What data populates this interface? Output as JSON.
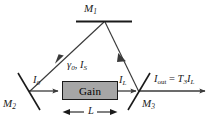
{
  "figure": {
    "type": "ring-laser-cavity-diagram",
    "background_color": "#ffffff",
    "line_color": "#3a3a3a",
    "mirror_color": "#1a1a1a",
    "gain_fill_color": "#a6a6a6",
    "gain_border_color": "#1a1a1a"
  },
  "mirrors": {
    "top": {
      "name": "M1",
      "label_base": "M",
      "label_sub": "1"
    },
    "left": {
      "name": "M2",
      "label_base": "M",
      "label_sub": "2"
    },
    "right": {
      "name": "M3",
      "label_base": "M",
      "label_sub": "3"
    }
  },
  "gain_medium": {
    "box_label": "Gain",
    "params_gamma": "γ",
    "params_gamma_sub": "0",
    "params_comma": ",",
    "params_is_base": "I",
    "params_is_sub": "S",
    "length_label": "L"
  },
  "beams": {
    "input_intensity_base": "I",
    "input_intensity_sub": "0",
    "output_intensity_base": "I",
    "output_intensity_sub": "L",
    "out_base": "I",
    "out_sub": "out",
    "out_equals": "=",
    "out_t_base": "T",
    "out_t_sub": "3",
    "out_i_base": "I",
    "out_i_sub": "L"
  }
}
